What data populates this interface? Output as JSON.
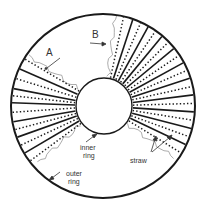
{
  "diagram": {
    "colors": {
      "stroke": "#1a1a1a",
      "fringe": "#888888",
      "text": "#333333",
      "background": "#ffffff"
    },
    "outer_ring": {
      "cx": 103,
      "cy": 106,
      "r": 92
    },
    "inner_ring": {
      "cx": 104,
      "cy": 106,
      "r": 28
    },
    "straw_sectors": {
      "right": {
        "solid_angles": [
          -71,
          -60.3,
          -49.7,
          -39,
          -28.3,
          -17.7,
          -7,
          3.7,
          14.3,
          25
        ],
        "dotted_extra": [
          -77,
          31
        ]
      },
      "left": {
        "solid_angles": [
          204,
          191,
          182,
          170,
          160,
          149
        ],
        "dotted_extra": [
          211,
          143
        ]
      }
    },
    "labels": {
      "a": "A",
      "b": "B",
      "inner_ring_line1": "inner",
      "inner_ring_line2": "ring",
      "outer_ring_line1": "outer",
      "outer_ring_line2": "ring",
      "straw": "straw"
    }
  }
}
